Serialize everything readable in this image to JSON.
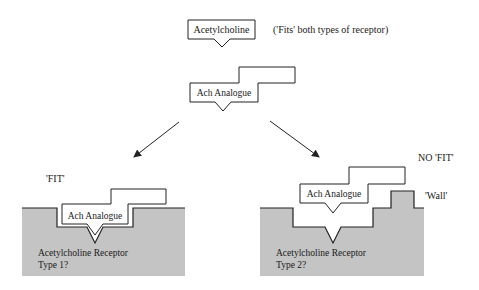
{
  "diagram": {
    "top": {
      "ligand_label": "Acetylcholine",
      "note": "('Fits' both types of receptor)",
      "analogue_label": "Ach Analogue"
    },
    "left_panel": {
      "status_label": "'FIT'",
      "analogue_label": "Ach Analogue",
      "receptor_label_line1": "Acetylcholine Receptor",
      "receptor_label_line2": "Type 1?"
    },
    "right_panel": {
      "status_label": "NO 'FIT'",
      "wall_label": "'Wall'",
      "analogue_label": "Ach Analogue",
      "receptor_label_line1": "Acetylcholine Receptor",
      "receptor_label_line2": "Type 2?"
    },
    "colors": {
      "receptor_fill": "#c4c4c4",
      "stroke": "#222222",
      "background": "#ffffff"
    }
  }
}
